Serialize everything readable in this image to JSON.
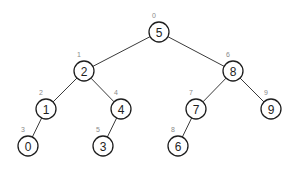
{
  "diagram": {
    "type": "binary-tree",
    "colors": {
      "edge": "#3a3a3a",
      "node_stroke": "#1e1e1e",
      "node_fill": "#ffffff",
      "value_text": "#1e1e1e",
      "index_text": "#8a8a8a",
      "background": "#ffffff"
    },
    "node_radius": 10,
    "nodes": [
      {
        "id": "n5",
        "value": "5",
        "index": "0",
        "x": 159,
        "y": 32
      },
      {
        "id": "n2",
        "value": "2",
        "index": "1",
        "x": 84,
        "y": 71
      },
      {
        "id": "n1",
        "value": "1",
        "index": "2",
        "x": 46,
        "y": 109
      },
      {
        "id": "n0",
        "value": "0",
        "index": "3",
        "x": 28,
        "y": 146
      },
      {
        "id": "n4",
        "value": "4",
        "index": "4",
        "x": 121,
        "y": 109
      },
      {
        "id": "n3",
        "value": "3",
        "index": "5",
        "x": 103,
        "y": 146
      },
      {
        "id": "n8",
        "value": "8",
        "index": "6",
        "x": 233,
        "y": 71
      },
      {
        "id": "n7",
        "value": "7",
        "index": "7",
        "x": 196,
        "y": 109
      },
      {
        "id": "n6",
        "value": "6",
        "index": "8",
        "x": 178,
        "y": 146
      },
      {
        "id": "n9",
        "value": "9",
        "index": "9",
        "x": 271,
        "y": 109
      }
    ],
    "edges": [
      {
        "from": "n5",
        "to": "n2"
      },
      {
        "from": "n5",
        "to": "n8"
      },
      {
        "from": "n2",
        "to": "n1"
      },
      {
        "from": "n2",
        "to": "n4"
      },
      {
        "from": "n1",
        "to": "n0"
      },
      {
        "from": "n4",
        "to": "n3"
      },
      {
        "from": "n8",
        "to": "n7"
      },
      {
        "from": "n8",
        "to": "n9"
      },
      {
        "from": "n7",
        "to": "n6"
      }
    ]
  }
}
